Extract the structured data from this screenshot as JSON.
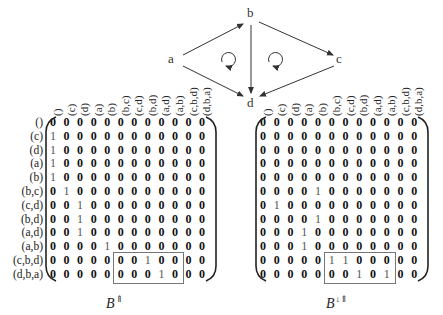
{
  "graph": {
    "nodes": [
      {
        "id": "a",
        "label": "a",
        "x": 160,
        "y": 57
      },
      {
        "id": "b",
        "label": "b",
        "x": 250,
        "y": 13
      },
      {
        "id": "c",
        "label": "c",
        "x": 339,
        "y": 57
      },
      {
        "id": "d",
        "label": "d",
        "x": 250,
        "y": 98
      }
    ],
    "edges": [
      {
        "from": "a",
        "to": "b"
      },
      {
        "from": "a",
        "to": "d"
      },
      {
        "from": "b",
        "to": "d"
      },
      {
        "from": "b",
        "to": "c"
      },
      {
        "from": "c",
        "to": "d"
      }
    ],
    "cycles": [
      "clockwise-loop-left-face",
      "clockwise-loop-right-face"
    ]
  },
  "labels": [
    "()",
    "(c)",
    "(d)",
    "(a)",
    "(b)",
    "(b,c)",
    "(c,d)",
    "(b,d)",
    "(a,d)",
    "(a,b)",
    "(c,b,d)",
    "(d,b,a)"
  ],
  "matrices": [
    {
      "name": "B⇑",
      "base": "B",
      "superscript": "⇑",
      "rows": [
        [
          0,
          0,
          0,
          0,
          0,
          0,
          0,
          0,
          0,
          0,
          0,
          0
        ],
        [
          1,
          0,
          0,
          0,
          0,
          0,
          0,
          0,
          0,
          0,
          0,
          0
        ],
        [
          1,
          0,
          0,
          0,
          0,
          0,
          0,
          0,
          0,
          0,
          0,
          0
        ],
        [
          1,
          0,
          0,
          0,
          0,
          0,
          0,
          0,
          0,
          0,
          0,
          0
        ],
        [
          1,
          0,
          0,
          0,
          0,
          0,
          0,
          0,
          0,
          0,
          0,
          0
        ],
        [
          0,
          1,
          0,
          0,
          0,
          0,
          0,
          0,
          0,
          0,
          0,
          0
        ],
        [
          0,
          0,
          1,
          0,
          0,
          0,
          0,
          0,
          0,
          0,
          0,
          0
        ],
        [
          0,
          0,
          1,
          0,
          0,
          0,
          0,
          0,
          0,
          0,
          0,
          0
        ],
        [
          0,
          0,
          1,
          0,
          0,
          0,
          0,
          0,
          0,
          0,
          0,
          0
        ],
        [
          0,
          0,
          0,
          0,
          1,
          0,
          0,
          0,
          0,
          0,
          0,
          0
        ],
        [
          0,
          0,
          0,
          0,
          0,
          0,
          0,
          1,
          0,
          0,
          0,
          0
        ],
        [
          0,
          0,
          0,
          0,
          0,
          0,
          0,
          0,
          1,
          0,
          0,
          0
        ]
      ],
      "highlight_box": {
        "row_start": 10,
        "row_end": 11,
        "col_start": 5,
        "col_end": 9
      }
    },
    {
      "name": "B↓⇑",
      "base": "B",
      "superscript": "↓⇑",
      "rows": [
        [
          0,
          0,
          0,
          0,
          0,
          0,
          0,
          0,
          0,
          0,
          0,
          0
        ],
        [
          0,
          0,
          0,
          0,
          0,
          0,
          0,
          0,
          0,
          0,
          0,
          0
        ],
        [
          0,
          0,
          0,
          0,
          0,
          0,
          0,
          0,
          0,
          0,
          0,
          0
        ],
        [
          0,
          0,
          0,
          0,
          0,
          0,
          0,
          0,
          0,
          0,
          0,
          0
        ],
        [
          0,
          0,
          0,
          0,
          0,
          0,
          0,
          0,
          0,
          0,
          0,
          0
        ],
        [
          0,
          0,
          0,
          0,
          1,
          0,
          0,
          0,
          0,
          0,
          0,
          0
        ],
        [
          0,
          1,
          0,
          0,
          0,
          0,
          0,
          0,
          0,
          0,
          0,
          0
        ],
        [
          0,
          0,
          0,
          0,
          1,
          0,
          0,
          0,
          0,
          0,
          0,
          0
        ],
        [
          0,
          0,
          0,
          1,
          0,
          0,
          0,
          0,
          0,
          0,
          0,
          0
        ],
        [
          0,
          0,
          0,
          1,
          0,
          0,
          0,
          0,
          0,
          0,
          0,
          0
        ],
        [
          0,
          0,
          0,
          0,
          0,
          1,
          1,
          0,
          0,
          0,
          0,
          0
        ],
        [
          0,
          0,
          0,
          0,
          0,
          0,
          0,
          1,
          0,
          1,
          0,
          0
        ]
      ],
      "highlight_box": {
        "row_start": 10,
        "row_end": 11,
        "col_start": 5,
        "col_end": 9
      }
    }
  ]
}
